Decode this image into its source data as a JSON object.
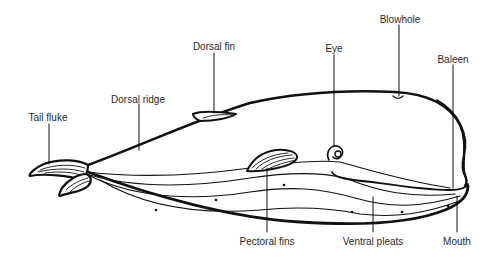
{
  "diagram": {
    "line_color": "#111111",
    "label_color": "#2a2a2a",
    "background": "#ffffff",
    "labels": [
      {
        "id": "tail-fluke",
        "text": "Tail fluke",
        "x": 48,
        "y": 112
      },
      {
        "id": "dorsal-ridge",
        "text": "Dorsal ridge",
        "x": 138,
        "y": 94
      },
      {
        "id": "dorsal-fin",
        "text": "Dorsal fin",
        "x": 214,
        "y": 41
      },
      {
        "id": "eye",
        "text": "Eye",
        "x": 334,
        "y": 43
      },
      {
        "id": "blowhole",
        "text": "Blowhole",
        "x": 400,
        "y": 14
      },
      {
        "id": "baleen",
        "text": "Baleen",
        "x": 453,
        "y": 54
      },
      {
        "id": "pectoral-fins",
        "text": "Pectoral fins",
        "x": 267,
        "y": 236
      },
      {
        "id": "ventral-pleats",
        "text": "Ventral pleats",
        "x": 373,
        "y": 236
      },
      {
        "id": "mouth",
        "text": "Mouth",
        "x": 457,
        "y": 236
      }
    ]
  }
}
